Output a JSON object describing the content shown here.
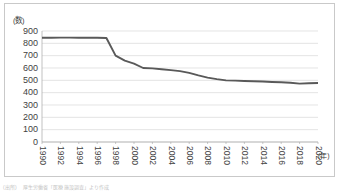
{
  "axes": {
    "y_unit_label": "(数)",
    "x_unit_label": "(年)",
    "y_ticks": [
      "900",
      "800",
      "700",
      "600",
      "500",
      "400",
      "300",
      "200",
      "100",
      "0"
    ],
    "x_ticks": [
      "1990",
      "1992",
      "1994",
      "1996",
      "1998",
      "2000",
      "2002",
      "2004",
      "2006",
      "2008",
      "2010",
      "2012",
      "2014",
      "2016",
      "2018",
      "2020"
    ]
  },
  "footnote": {
    "source_label": "(出所)",
    "source_text": "厚生労働省「医療施設調査」より作成"
  },
  "style": {
    "line_color": "#595959",
    "grid_color": "#d9d9d9",
    "axis_color": "#a6a6a6",
    "frame_color": "#c9c9c9"
  },
  "chart_data": {
    "type": "line",
    "title": "",
    "xlabel": "(年)",
    "ylabel": "(数)",
    "xlim": [
      1990,
      2020
    ],
    "ylim": [
      0,
      900
    ],
    "grid": true,
    "legend": false,
    "y_tick_step": 100,
    "x_tick_step": 2,
    "x": [
      1990,
      1991,
      1992,
      1993,
      1994,
      1995,
      1996,
      1997,
      1998,
      1999,
      2000,
      2001,
      2002,
      2003,
      2004,
      2005,
      2006,
      2007,
      2008,
      2009,
      2010,
      2011,
      2012,
      2013,
      2014,
      2015,
      2016,
      2017,
      2018,
      2019,
      2020
    ],
    "series": [
      {
        "name": "施設数",
        "values": [
          845,
          845,
          846,
          846,
          845,
          845,
          845,
          843,
          700,
          660,
          635,
          600,
          597,
          590,
          583,
          575,
          560,
          540,
          522,
          510,
          500,
          498,
          495,
          492,
          490,
          487,
          484,
          480,
          473,
          476,
          478
        ]
      }
    ]
  }
}
